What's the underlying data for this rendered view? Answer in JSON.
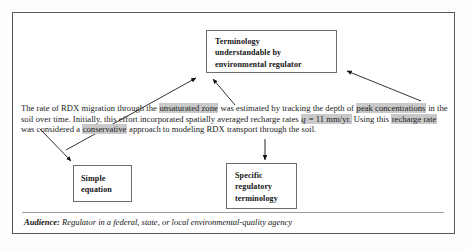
{
  "figure": {
    "frame_color": "#555a5c",
    "background": "#ffffff",
    "highlight_color": "#c9c9c9"
  },
  "boxes": {
    "terminology": {
      "name": "terminology-box",
      "lines": [
        "Terminology",
        "understandable by",
        "environmental regulator"
      ]
    },
    "simple_equation": {
      "name": "simple-equation-box",
      "lines": [
        "Simple",
        "equation"
      ]
    },
    "specific_terminology": {
      "name": "specific-regulatory-terminology-box",
      "lines": [
        "Specific",
        "regulatory",
        "terminology"
      ]
    }
  },
  "paragraph": {
    "segments": [
      {
        "text": "The rate of RDX migration through the ",
        "highlight": false,
        "italic": false
      },
      {
        "text": "unsaturated zone",
        "highlight": true,
        "italic": false
      },
      {
        "text": " was estimated by tracking the depth of ",
        "highlight": false,
        "italic": false
      },
      {
        "text": "peak concentrations",
        "highlight": true,
        "italic": false
      },
      {
        "text": " in the soil over time.  Initially, this effort incorporated spatially averaged recharge rates ",
        "highlight": false,
        "italic": false
      },
      {
        "text": "q",
        "highlight": true,
        "italic": true
      },
      {
        "text": " = 11 mm/yr.",
        "highlight": true,
        "italic": false
      },
      {
        "text": " Using this ",
        "highlight": false,
        "italic": false
      },
      {
        "text": "recharge rate",
        "highlight": true,
        "italic": false
      },
      {
        "text": " was considered a ",
        "highlight": false,
        "italic": false
      },
      {
        "text": "conservative",
        "highlight": true,
        "italic": false
      },
      {
        "text": " approach to modeling RDX transport through the soil.",
        "highlight": false,
        "italic": false
      }
    ]
  },
  "audience": {
    "label": "Audience:",
    "text": " Regulator in a federal, state, or local environmental-quality agency"
  },
  "arrows": [
    {
      "name": "arrow-unsaturated-zone-to-terminology",
      "from": [
        68,
        148
      ],
      "to": [
        196,
        77
      ]
    },
    {
      "name": "arrow-peak-concentrations-to-terminology",
      "from": [
        234,
        104
      ],
      "to": [
        213,
        78
      ]
    },
    {
      "name": "arrow-recharge-rate-to-terminology",
      "from": [
        420,
        101
      ],
      "to": [
        345,
        70
      ]
    },
    {
      "name": "arrow-equation-to-simple-equation-box",
      "from": [
        42,
        131
      ],
      "to": [
        72,
        162
      ]
    },
    {
      "name": "arrow-conservative-to-specific-terminology",
      "from": [
        265,
        138
      ],
      "to": [
        265,
        161
      ]
    }
  ]
}
